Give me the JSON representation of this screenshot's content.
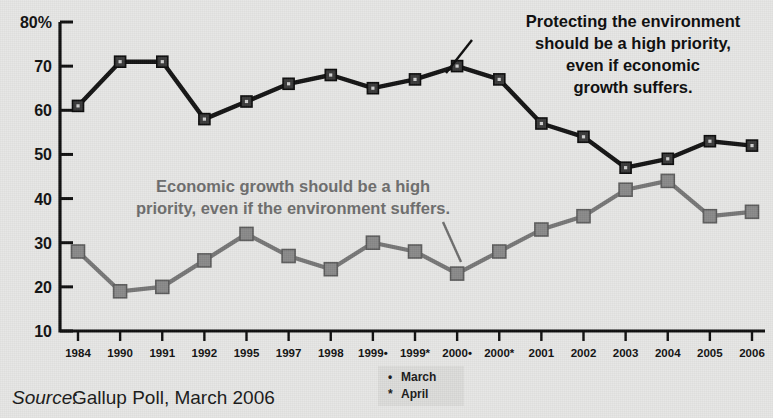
{
  "chart_data": {
    "type": "line",
    "title": "",
    "xlabel": "",
    "ylabel": "",
    "ylim": [
      10,
      80
    ],
    "yticks": [
      10,
      20,
      30,
      40,
      50,
      60,
      70,
      80
    ],
    "ytick_labels": [
      "10",
      "20",
      "30",
      "40",
      "50",
      "60",
      "70",
      "80%"
    ],
    "grid": false,
    "legend_position": "bottom-center",
    "categories": [
      "1984",
      "1990",
      "1991",
      "1992",
      "1995",
      "1997",
      "1998",
      "1999•",
      "1999*",
      "2000•",
      "2000*",
      "2001",
      "2002",
      "2003",
      "2004",
      "2005",
      "2006"
    ],
    "series": [
      {
        "name": "Protecting the environment should be a high priority, even if economic growth suffers.",
        "color": "#141414",
        "values": [
          61,
          71,
          71,
          58,
          62,
          66,
          68,
          65,
          67,
          70,
          67,
          57,
          54,
          47,
          49,
          53,
          52
        ]
      },
      {
        "name": "Economic growth should be a high priority, even if the environment suffers.",
        "color": "#777777",
        "values": [
          28,
          19,
          20,
          26,
          32,
          27,
          24,
          30,
          28,
          23,
          28,
          33,
          36,
          42,
          44,
          36,
          37
        ]
      }
    ],
    "annotations": [
      {
        "id": "dark-annotation",
        "color": "#0d0d0d",
        "lines": [
          "Protecting the environment",
          "should be a high priority,",
          "even if economic",
          "growth suffers."
        ],
        "points_to_category": "2000•"
      },
      {
        "id": "gray-annotation",
        "color": "#6e6e6e",
        "lines": [
          "Economic growth should be a high",
          "priority, even if the environment suffers."
        ],
        "points_to_category": "2000•"
      }
    ],
    "legend": [
      {
        "marker": "•",
        "label": "March"
      },
      {
        "marker": "*",
        "label": "April"
      }
    ]
  },
  "source": {
    "prefix": "Source:",
    "text": "Gallup Poll, March 2006"
  },
  "colors": {
    "background": "#e7e7e5",
    "axis": "#0f0f0f",
    "series_dark": "#141414",
    "series_gray": "#777777",
    "marker_gray_fill": "#8a8a8a",
    "legend_background": "#dcdcda"
  }
}
